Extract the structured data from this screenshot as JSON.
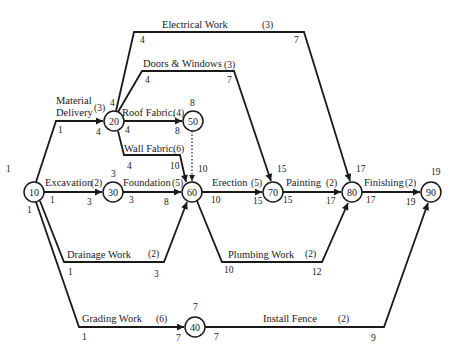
{
  "diagram": {
    "type": "activity-on-arrow network",
    "nodes": [
      {
        "id": "10",
        "label": "10",
        "top_time": "1",
        "bottom_time": "1"
      },
      {
        "id": "20",
        "label": "20"
      },
      {
        "id": "30",
        "label": "30",
        "top_time": "3"
      },
      {
        "id": "40",
        "label": "40",
        "top_time": "7"
      },
      {
        "id": "50",
        "label": "50",
        "top_time": "8"
      },
      {
        "id": "60",
        "label": "60",
        "top_time": "10"
      },
      {
        "id": "70",
        "label": "70",
        "top_time": "15"
      },
      {
        "id": "80",
        "label": "80",
        "top_time": "17"
      },
      {
        "id": "90",
        "label": "90",
        "top_time": "19"
      }
    ],
    "activities": [
      {
        "name": "Material Delivery",
        "name_line1": "Material",
        "name_line2": "Delivery",
        "duration": "(3)",
        "from": "10",
        "to": "20",
        "start": "1",
        "end": "4"
      },
      {
        "name": "Electrical Work",
        "duration": "(3)",
        "from": "20",
        "to": "80",
        "start": "4",
        "end": "7",
        "from_mark": "4"
      },
      {
        "name": "Doors & Windows",
        "duration": "(3)",
        "from": "20",
        "to": "70",
        "start": "4",
        "end": "7"
      },
      {
        "name": "Roof Fabric.",
        "duration": "(4)",
        "from": "20",
        "to": "50",
        "start": "4",
        "end": "8"
      },
      {
        "name": "Wall Fabric.",
        "duration": "(6)",
        "from": "20",
        "to": "60",
        "start": "4",
        "end": "10"
      },
      {
        "name": "Excavation",
        "duration": "(2)",
        "from": "10",
        "to": "30",
        "start": "1",
        "end": "3"
      },
      {
        "name": "Foundation",
        "duration": "(5)",
        "from": "30",
        "to": "60",
        "start": "3",
        "end": "8"
      },
      {
        "name": "Drainage Work",
        "duration": "(2)",
        "from": "10",
        "to": "60",
        "start": "1",
        "end": "3"
      },
      {
        "name": "Erection",
        "duration": "(5)",
        "from": "60",
        "to": "70",
        "start": "10",
        "end": "15"
      },
      {
        "name": "Plumbing Work",
        "duration": "(2)",
        "from": "60",
        "to": "80",
        "start": "10",
        "end": "12"
      },
      {
        "name": "Painting",
        "duration": "(2)",
        "from": "70",
        "to": "80",
        "start": "15",
        "end": "17"
      },
      {
        "name": "Finishing",
        "duration": "(2)",
        "from": "80",
        "to": "90",
        "start": "17",
        "end": "19"
      },
      {
        "name": "Grading Work",
        "duration": "(6)",
        "from": "10",
        "to": "40",
        "start": "1",
        "end": "7"
      },
      {
        "name": "Install Fence",
        "duration": "(2)",
        "from": "40",
        "to": "90",
        "start": "7",
        "end": "9"
      },
      {
        "name": "Dummy",
        "duration": "",
        "from": "50",
        "to": "60",
        "start": "",
        "end": ""
      }
    ]
  }
}
